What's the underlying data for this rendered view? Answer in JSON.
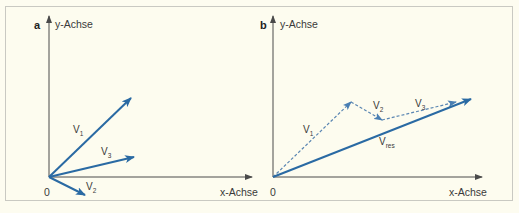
{
  "figure": {
    "panels": [
      {
        "id": "a",
        "label": "a",
        "y_axis_label": "y-Achse",
        "x_axis_label": "x-Achse",
        "origin_label": "0",
        "vectors": [
          {
            "name": "V",
            "sub": "1",
            "style": "solid"
          },
          {
            "name": "V",
            "sub": "2",
            "style": "solid"
          },
          {
            "name": "V",
            "sub": "3",
            "style": "solid"
          }
        ]
      },
      {
        "id": "b",
        "label": "b",
        "y_axis_label": "y-Achse",
        "x_axis_label": "x-Achse",
        "origin_label": "0",
        "vectors": [
          {
            "name": "V",
            "sub": "1",
            "style": "dashed"
          },
          {
            "name": "V",
            "sub": "2",
            "style": "dashed"
          },
          {
            "name": "V",
            "sub": "3",
            "style": "dashed"
          },
          {
            "name": "V",
            "sub": "res",
            "style": "solid"
          }
        ]
      }
    ],
    "colors": {
      "vector": "#2a6aa3",
      "dashed_vector": "#5a86b2",
      "axis": "#4a4a4a",
      "background": "#fdfcef",
      "border": "#c9c9c2"
    }
  }
}
